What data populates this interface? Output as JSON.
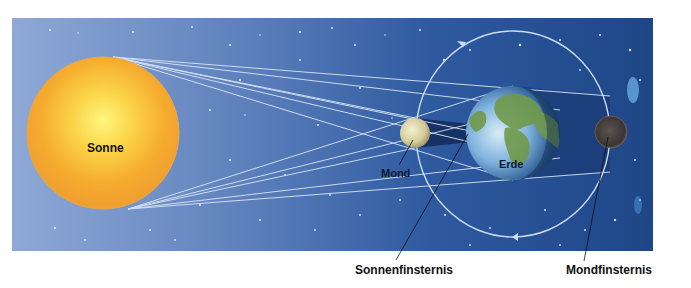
{
  "diagram": {
    "type": "eclipse-illustration",
    "bodies": {
      "sun": {
        "label": "Sonne",
        "color": "#f5a623",
        "core_color": "#fff36b"
      },
      "moon": {
        "label": "Mond",
        "color": "#d9d3a8"
      },
      "earth": {
        "label": "Erde",
        "ocean_color": "#3f7fc4",
        "land_color": "#6f9a4a"
      },
      "eclipsed_moon": {
        "color": "#3e3a3a"
      }
    },
    "callouts": {
      "solar_eclipse": "Sonnenfinsternis",
      "lunar_eclipse": "Mondfinsternis"
    },
    "colors": {
      "space_left": "#8ea8d4",
      "space_right": "#1f4a8c",
      "ray": "#d6e4f5",
      "orbit": "#c9dcf2",
      "page_bg": "#ffffff"
    }
  }
}
